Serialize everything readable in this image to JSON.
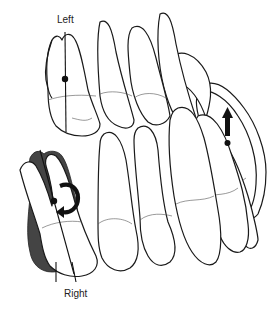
{
  "diagram": {
    "labels": {
      "left": "Left",
      "right": "Right"
    },
    "annotations": [
      {
        "id": "left-tooth-axis",
        "type": "long-axis-line-with-center-dot",
        "tooth": "upper-left-first"
      },
      {
        "id": "right-tooth-rotation",
        "type": "curved-rotation-arrow",
        "tooth": "lower-left-first",
        "note": "shaded outline shows displaced position"
      },
      {
        "id": "extrusion-arrow",
        "type": "upward-arrow-with-dot",
        "tooth": "upper-right-posterior"
      }
    ],
    "colors": {
      "line": "#1a1a1a",
      "shadow": "#444444",
      "background": "#ffffff"
    }
  }
}
